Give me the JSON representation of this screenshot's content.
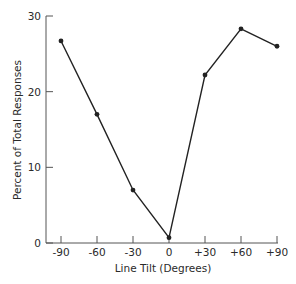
{
  "chart_data": {
    "type": "line",
    "title": "",
    "xlabel": "Line Tilt (Degrees)",
    "ylabel": "Percent of Total Responses",
    "categories": [
      "-90",
      "-60",
      "-30",
      "0",
      "+30",
      "+60",
      "+90"
    ],
    "x": [
      -90,
      -60,
      -30,
      0,
      30,
      60,
      90
    ],
    "series": [
      {
        "name": "Responses",
        "values": [
          26.7,
          17.0,
          7.0,
          0.7,
          22.2,
          28.3,
          26.0
        ]
      }
    ],
    "ylim": [
      0,
      30
    ],
    "yticks": [
      "0",
      "10",
      "20",
      "30"
    ],
    "xlim": [
      -90,
      90
    ],
    "grid": false,
    "legend": null,
    "line_color": "#222222",
    "marker": "circle"
  },
  "axes": {
    "xlabel": "Line Tilt (Degrees)",
    "ylabel": "Percent of Total Responses",
    "yticks": [
      "0",
      "10",
      "20",
      "30"
    ],
    "xticks": [
      "-90",
      "-60",
      "-30",
      "0",
      "+30",
      "+60",
      "+90"
    ]
  }
}
